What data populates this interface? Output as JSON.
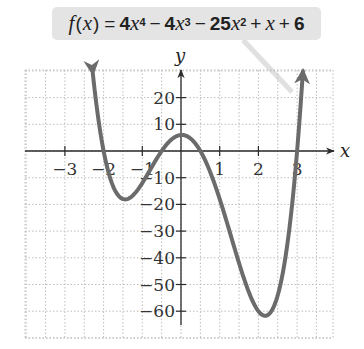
{
  "chart_data": {
    "type": "line",
    "function": {
      "coefficients_desc": [
        4,
        -4,
        -25,
        1,
        6
      ],
      "x_start": -2.28,
      "x_end": 3.15
    },
    "xlabel": "x",
    "ylabel": "y",
    "xlim": [
      -4.05,
      3.9
    ],
    "ylim": [
      -70,
      30
    ],
    "x_ticks": [
      -3,
      -2,
      -1,
      1,
      2,
      3
    ],
    "x_tick_labels": [
      "−3",
      "−2",
      "−1",
      "1",
      "2",
      "3"
    ],
    "y_ticks": [
      20,
      10,
      -10,
      -20,
      -30,
      -40,
      -50,
      -60
    ],
    "y_tick_labels": [
      "20",
      "10",
      "−10",
      "−20",
      "−30",
      "−40",
      "−50",
      "−60"
    ],
    "grid": {
      "on": true,
      "x_step": 0.5,
      "y_step": 10,
      "style": "dotted"
    },
    "key_points": [
      {
        "label": "root",
        "x": -2,
        "y": 0
      },
      {
        "label": "local min",
        "x": -1.45,
        "y": -18.2
      },
      {
        "label": "root",
        "x": -0.5,
        "y": 0
      },
      {
        "label": "local max",
        "x": 0.02,
        "y": 6
      },
      {
        "label": "root",
        "x": 0.5,
        "y": 0
      },
      {
        "label": "local min",
        "x": 2.2,
        "y": -61
      },
      {
        "label": "root",
        "x": 3,
        "y": 0
      }
    ],
    "series": [
      {
        "name": "f(x)",
        "color": "#6b6b6b",
        "arrows_both_ends": true
      }
    ]
  },
  "label": {
    "fx": "f",
    "paren_open": "(",
    "x": "x",
    "paren_close": ")",
    "eq": "=",
    "t1_coef": "4",
    "t1_exp": "4",
    "minus1": "−",
    "t2_coef": "4",
    "t2_exp": "3",
    "minus2": "−",
    "t3_coef": "25",
    "t3_exp": "2",
    "plus1": "+",
    "t4": "x",
    "plus2": "+",
    "t5": "6"
  },
  "colors": {
    "curve": "#6b6b6b",
    "axis": "#2a2a2a",
    "grid": "#bdbdbd",
    "label_bg": "#e4e4e4",
    "pointer": "#e0e0e0"
  }
}
